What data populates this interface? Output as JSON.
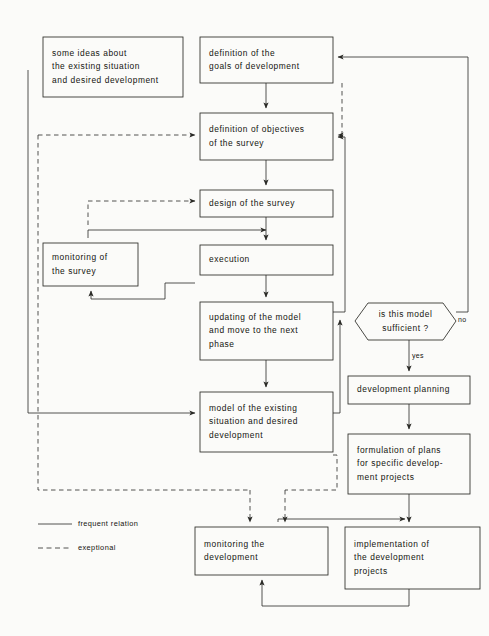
{
  "diagram": {
    "stroke_color": "#2a2a26",
    "background_color": "#fbfbf9",
    "nodes": [
      {
        "id": "ideas",
        "shape": "rect",
        "label": "some ideas about\nthe existing  situation\nand desired development"
      },
      {
        "id": "goals",
        "shape": "rect",
        "label": "definition of the\ngoals of development"
      },
      {
        "id": "objectives",
        "shape": "rect",
        "label": "definition of objectives\nof  the survey"
      },
      {
        "id": "design",
        "shape": "rect",
        "label": "design of  the  survey"
      },
      {
        "id": "execution",
        "shape": "rect",
        "label": "execution"
      },
      {
        "id": "monitorsurvey",
        "shape": "rect",
        "label": "monitoring of\nthe  survey"
      },
      {
        "id": "updating",
        "shape": "rect",
        "label": "updating of the model\nand  move to the next\nphase"
      },
      {
        "id": "sufficient",
        "shape": "hexagon",
        "label": "is  this model\nsufficient ?"
      },
      {
        "id": "model",
        "shape": "rect",
        "label": "model of the existing\nsituation and desired\ndevelopment"
      },
      {
        "id": "devplanning",
        "shape": "rect",
        "label": "development  planning"
      },
      {
        "id": "formulation",
        "shape": "rect",
        "label": "formulation of plans\nfor specific  develop-\nment  projects"
      },
      {
        "id": "monitordev",
        "shape": "rect",
        "label": "monitoring the\ndevelopment"
      },
      {
        "id": "implement",
        "shape": "rect",
        "label": "implementation of\nthe development\nprojects"
      }
    ],
    "edge_tags": [
      {
        "id": "no-tag",
        "label": "no"
      },
      {
        "id": "yes-tag",
        "label": "yes"
      }
    ],
    "legend": [
      {
        "id": "frequent",
        "style": "solid",
        "label": "frequent relation"
      },
      {
        "id": "exeptional",
        "style": "dashed",
        "label": "exeptional"
      }
    ]
  }
}
